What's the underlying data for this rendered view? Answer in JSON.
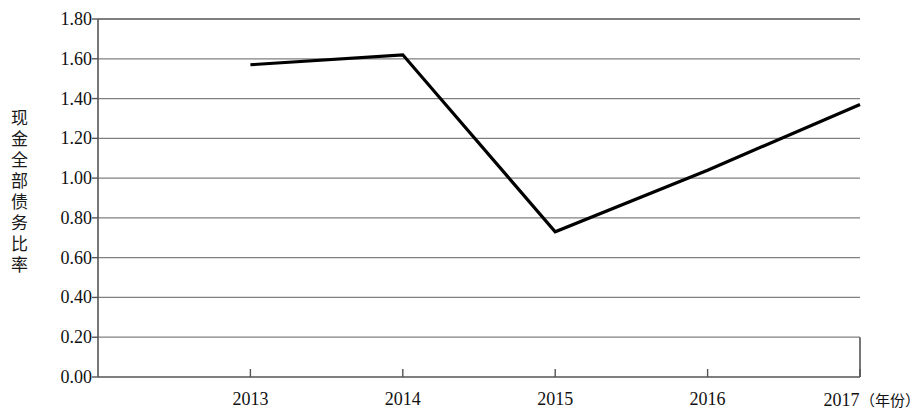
{
  "chart_data": {
    "type": "line",
    "title": "",
    "subtitle": "",
    "xlabel": "年份",
    "ylabel": "现金全部债务比率",
    "x": [
      "2013",
      "2014",
      "2015",
      "2016",
      "2017"
    ],
    "categories": [
      "2013",
      "2014",
      "2015",
      "2016",
      "2017"
    ],
    "values": [
      1.57,
      1.62,
      0.73,
      1.04,
      1.37
    ],
    "series": [
      {
        "name": "现金全部债务比率",
        "values": [
          1.57,
          1.62,
          0.73,
          1.04,
          1.37
        ]
      }
    ],
    "ylim": [
      0.0,
      1.8
    ],
    "ytick_values": [
      0.0,
      0.2,
      0.4,
      0.6,
      0.8,
      1.0,
      1.2,
      1.4,
      1.6,
      1.8
    ],
    "ytick_labels": [
      "0.00",
      "0.20",
      "0.40",
      "0.60",
      "0.80",
      "1.00",
      "1.20",
      "1.40",
      "1.60",
      "1.80"
    ],
    "xtick_labels": [
      "2013",
      "2014",
      "2015",
      "2016",
      "2017"
    ],
    "xaxis_unit_label": "（年份）",
    "grid": true,
    "grid_axis": "y",
    "legend": "none",
    "line_color": "#000000",
    "grid_color": "#808080",
    "axis_color": "#555555",
    "background": "#ffffff",
    "markers": false
  },
  "axis": {
    "y_title": "现金全部债务比率",
    "x_last_label_full": "2017（年份）"
  }
}
